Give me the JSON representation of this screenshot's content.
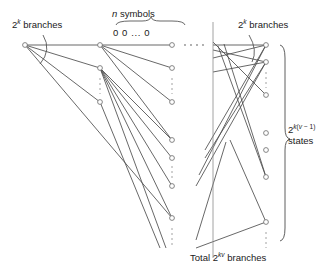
{
  "figure": {
    "type": "trellis-diagram",
    "title_labels": {
      "left_branches": {
        "base": "2",
        "exp": "k",
        "text": " branches",
        "full": "2^k branches"
      },
      "n_symbols": {
        "italic": "n",
        "text": " symbols",
        "full": "n symbols"
      },
      "zeros_word": "0 0 ... 0",
      "right_branches": {
        "base": "2",
        "exp": "k",
        "text": " branches",
        "full": "2^k branches"
      },
      "states": {
        "base": "2",
        "exp": "k(v − 1)",
        "text": "states",
        "full": "2^k(v-1) states"
      },
      "total_branches": {
        "prefix": "Total ",
        "base": "2",
        "exp": "kv",
        "text": " branches",
        "full": "Total 2^kv branches"
      }
    },
    "colors": {
      "stroke": "#4d4d4d",
      "node_stroke": "#707070",
      "node_fill": "#ffffff",
      "text": "#1a1a1a"
    },
    "nodes": [
      {
        "id": "a0",
        "x": 25,
        "y": 45
      },
      {
        "id": "b0",
        "x": 100,
        "y": 45
      },
      {
        "id": "b1",
        "x": 100,
        "y": 68
      },
      {
        "id": "b2",
        "x": 100,
        "y": 102
      },
      {
        "id": "c0",
        "x": 172,
        "y": 45
      },
      {
        "id": "c1",
        "x": 172,
        "y": 68
      },
      {
        "id": "c2",
        "x": 172,
        "y": 102
      },
      {
        "id": "c3",
        "x": 172,
        "y": 140
      },
      {
        "id": "c4",
        "x": 172,
        "y": 158
      },
      {
        "id": "c5",
        "x": 172,
        "y": 186
      },
      {
        "id": "c6",
        "x": 172,
        "y": 218
      },
      {
        "id": "d0",
        "x": 266,
        "y": 45
      },
      {
        "id": "d1",
        "x": 266,
        "y": 62
      },
      {
        "id": "d2",
        "x": 266,
        "y": 95
      },
      {
        "id": "d3",
        "x": 266,
        "y": 133
      },
      {
        "id": "d4",
        "x": 266,
        "y": 150
      },
      {
        "id": "d5",
        "x": 266,
        "y": 177
      },
      {
        "id": "d6",
        "x": 266,
        "y": 222
      }
    ],
    "edges_left": [
      [
        "a0",
        "b0"
      ],
      [
        "a0",
        "b1"
      ],
      [
        "a0",
        "b2"
      ],
      [
        "a0",
        "c6"
      ],
      [
        "b0",
        "c0"
      ],
      [
        "b0",
        "c1"
      ],
      [
        "b0",
        "c2"
      ],
      [
        "b0",
        "c3"
      ],
      [
        "b1",
        "c3"
      ],
      [
        "b1",
        "c4"
      ],
      [
        "b1",
        "c5"
      ],
      [
        "b1",
        "c6"
      ],
      [
        "b2",
        "c6"
      ]
    ],
    "edges_right": [
      [
        "c0",
        "d0"
      ],
      [
        "c0",
        "d1"
      ],
      [
        "c0",
        "d5"
      ],
      [
        "c1",
        "d0"
      ],
      [
        "c1",
        "d1"
      ],
      [
        "c2",
        "d0"
      ],
      [
        "c2",
        "d1"
      ],
      [
        "c5",
        "d0"
      ],
      [
        "c5",
        "d1"
      ],
      [
        "c6",
        "d6"
      ],
      [
        "c4",
        "d6"
      ]
    ],
    "vertical_divider": {
      "x": 213,
      "y1": 22,
      "y2": 258
    },
    "ellipsis_marks": [
      "top-horizontal",
      "column-vertical",
      "right-vertical"
    ]
  }
}
